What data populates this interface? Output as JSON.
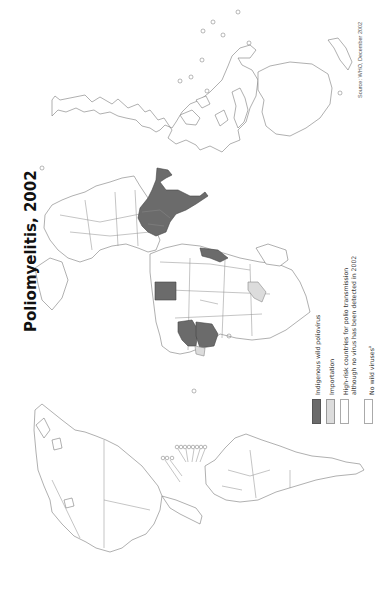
{
  "map": {
    "title": "Poliomyelitis, 2002",
    "source": "Source: WHO, December 2002",
    "orientation": "rotated 90° counter-clockwise (north at left)",
    "colors": {
      "indigenous": "#6b6b6b",
      "importation": "#dcdcdc",
      "high_risk": "#ffffff",
      "no_wild": "#ffffff",
      "outline": "#7a7a7a"
    },
    "regions": {
      "indigenous": [
        "Indian subcontinent (India, Pakistan, Afghanistan)",
        "Nigeria / Niger",
        "Egypt",
        "Somalia region"
      ],
      "importation": [
        "West African neighbours",
        "East Africa (Ethiopia region)"
      ]
    }
  },
  "legend": {
    "items": [
      {
        "label": "Indigenous wild poliovirus",
        "swatch": "#6b6b6b"
      },
      {
        "label": "Importation",
        "swatch": "#dcdcdc"
      },
      {
        "label_line1": "High-risk countries for polio transmission",
        "label_line2": "although no virus has been detected in 2002",
        "swatch": "#ffffff"
      },
      {
        "label": "No wild viruses",
        "superscript": "a",
        "swatch": "#ffffff"
      }
    ]
  }
}
